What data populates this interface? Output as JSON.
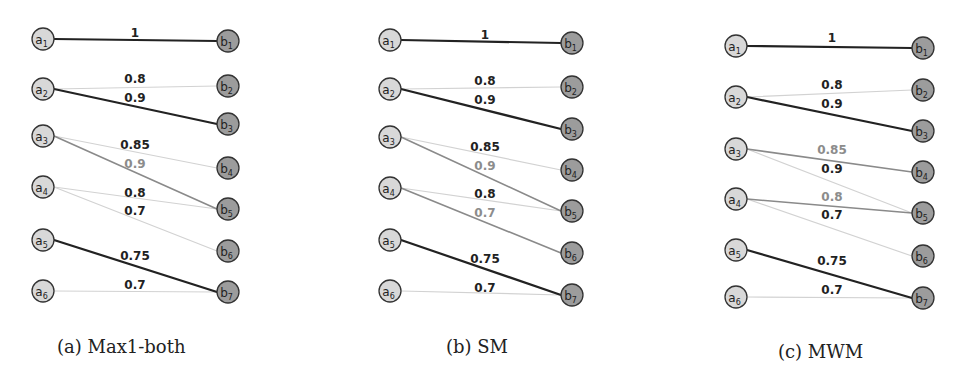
{
  "figure": {
    "panels": [
      {
        "id": "a",
        "caption": "(a) Max1-both",
        "caption_pos": [
          57,
          352
        ],
        "a_x": 43,
        "a_y": [
          39,
          89,
          136,
          187,
          240,
          291
        ],
        "b_x": 228,
        "b_y": [
          41,
          86,
          124,
          168,
          209,
          251,
          292
        ],
        "edges": [
          {
            "from": 1,
            "to": 1,
            "weight": "1",
            "style": "bold",
            "label_pos": [
              135,
              33
            ],
            "label_style": "dark"
          },
          {
            "from": 2,
            "to": 2,
            "weight": "0.8",
            "style": "light",
            "label_pos": [
              135,
              79
            ],
            "label_style": "dark"
          },
          {
            "from": 2,
            "to": 3,
            "weight": "0.9",
            "style": "bold",
            "label_pos": [
              135,
              98
            ],
            "label_style": "dark"
          },
          {
            "from": 3,
            "to": 4,
            "weight": "0.85",
            "style": "light",
            "label_pos": [
              135,
              145
            ],
            "label_style": "dark"
          },
          {
            "from": 3,
            "to": 5,
            "weight": "0.9",
            "style": "mid",
            "label_pos": [
              135,
              164
            ],
            "label_style": "gray"
          },
          {
            "from": 4,
            "to": 5,
            "weight": "0.8",
            "style": "light",
            "label_pos": [
              135,
              193
            ],
            "label_style": "dark"
          },
          {
            "from": 4,
            "to": 6,
            "weight": "0.7",
            "style": "light",
            "label_pos": [
              135,
              211
            ],
            "label_style": "dark"
          },
          {
            "from": 5,
            "to": 7,
            "weight": "0.75",
            "style": "bold",
            "label_pos": [
              135,
              256
            ],
            "label_style": "dark"
          },
          {
            "from": 6,
            "to": 7,
            "weight": "0.7",
            "style": "light",
            "label_pos": [
              135,
              285
            ],
            "label_style": "dark"
          }
        ]
      },
      {
        "id": "b",
        "caption": "(b) SM",
        "caption_pos": [
          446,
          352
        ],
        "a_x": 390,
        "a_y": [
          40,
          89,
          137,
          188,
          240,
          291
        ],
        "b_x": 572,
        "b_y": [
          43,
          87,
          129,
          170,
          211,
          253,
          295
        ],
        "edges": [
          {
            "from": 1,
            "to": 1,
            "weight": "1",
            "style": "bold",
            "label_pos": [
              485,
              35
            ],
            "label_style": "dark"
          },
          {
            "from": 2,
            "to": 2,
            "weight": "0.8",
            "style": "light",
            "label_pos": [
              485,
              81
            ],
            "label_style": "dark"
          },
          {
            "from": 2,
            "to": 3,
            "weight": "0.9",
            "style": "bold",
            "label_pos": [
              485,
              100
            ],
            "label_style": "dark"
          },
          {
            "from": 3,
            "to": 4,
            "weight": "0.85",
            "style": "light",
            "label_pos": [
              485,
              147
            ],
            "label_style": "dark"
          },
          {
            "from": 3,
            "to": 5,
            "weight": "0.9",
            "style": "mid",
            "label_pos": [
              485,
              166
            ],
            "label_style": "gray"
          },
          {
            "from": 4,
            "to": 5,
            "weight": "0.8",
            "style": "light",
            "label_pos": [
              485,
              194
            ],
            "label_style": "dark"
          },
          {
            "from": 4,
            "to": 6,
            "weight": "0.7",
            "style": "mid",
            "label_pos": [
              485,
              213
            ],
            "label_style": "gray"
          },
          {
            "from": 5,
            "to": 7,
            "weight": "0.75",
            "style": "bold",
            "label_pos": [
              485,
              259
            ],
            "label_style": "dark"
          },
          {
            "from": 6,
            "to": 7,
            "weight": "0.7",
            "style": "light",
            "label_pos": [
              485,
              288
            ],
            "label_style": "dark"
          }
        ]
      },
      {
        "id": "c",
        "caption": "(c) MWM",
        "caption_pos": [
          778,
          357
        ],
        "a_x": 736,
        "a_y": [
          46,
          97,
          149,
          199,
          250,
          297
        ],
        "b_x": 923,
        "b_y": [
          48,
          90,
          131,
          172,
          213,
          256,
          298
        ],
        "edges": [
          {
            "from": 1,
            "to": 1,
            "weight": "1",
            "style": "bold",
            "label_pos": [
              832,
              38
            ],
            "label_style": "dark"
          },
          {
            "from": 2,
            "to": 2,
            "weight": "0.8",
            "style": "light",
            "label_pos": [
              832,
              85
            ],
            "label_style": "dark"
          },
          {
            "from": 2,
            "to": 3,
            "weight": "0.9",
            "style": "bold",
            "label_pos": [
              832,
              104
            ],
            "label_style": "dark"
          },
          {
            "from": 3,
            "to": 4,
            "weight": "0.85",
            "style": "mid",
            "label_pos": [
              832,
              150
            ],
            "label_style": "gray"
          },
          {
            "from": 3,
            "to": 5,
            "weight": "0.9",
            "style": "light",
            "label_pos": [
              832,
              169
            ],
            "label_style": "dark"
          },
          {
            "from": 4,
            "to": 5,
            "weight": "0.8",
            "style": "mid",
            "label_pos": [
              832,
              197
            ],
            "label_style": "gray"
          },
          {
            "from": 4,
            "to": 6,
            "weight": "0.7",
            "style": "light",
            "label_pos": [
              832,
              215
            ],
            "label_style": "dark"
          },
          {
            "from": 5,
            "to": 7,
            "weight": "0.75",
            "style": "bold",
            "label_pos": [
              832,
              261
            ],
            "label_style": "dark"
          },
          {
            "from": 6,
            "to": 7,
            "weight": "0.7",
            "style": "light",
            "label_pos": [
              832,
              290
            ],
            "label_style": "dark"
          }
        ]
      }
    ],
    "node_prefix_left": "a",
    "node_prefix_right": "b",
    "colors": {
      "left_node_fill": "#d8d8d8",
      "right_node_fill": "#9c9c9c",
      "node_stroke": "#333333",
      "edge_bold": "#222222",
      "edge_mid": "#8a8a8a",
      "edge_light": "#d2d2d2",
      "label_dark": "#222222",
      "label_gray": "#8c8c8c"
    }
  }
}
